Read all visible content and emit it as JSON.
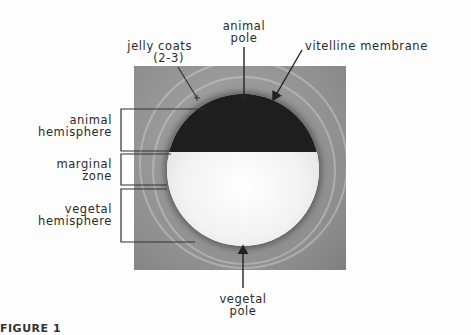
{
  "figure": {
    "labels": {
      "jelly_coats": [
        "jelly coats",
        "(2-3)"
      ],
      "animal_pole": [
        "animal",
        "pole"
      ],
      "vitelline_membrane": "vitelline membrane",
      "animal_hemisphere": [
        "animal",
        "hemisphere"
      ],
      "marginal_zone": [
        "marginal",
        "zone"
      ],
      "vegetal_hemisphere": [
        "vegetal",
        "hemisphere"
      ],
      "vegetal_pole": [
        "vegetal",
        "pole"
      ]
    },
    "caption_partial": "FIGURE 1"
  },
  "colors": {
    "animal_hemisphere": "#1e1e1e",
    "vegetal_hemisphere": "#f2f2f2",
    "background_photo": "#999999",
    "label_text": "#2a2a2a"
  }
}
